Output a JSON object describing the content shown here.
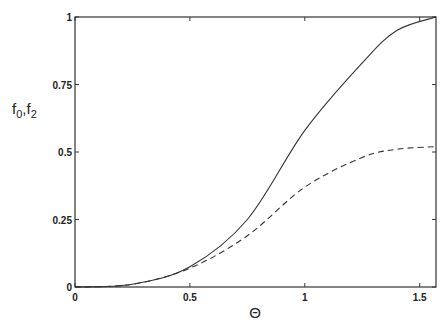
{
  "chart_data": {
    "type": "line",
    "title": "",
    "xlabel": "Θ",
    "ylabel": "f0,f2",
    "ylabel_parts": {
      "f": "f",
      "sub0": "0",
      "comma": ",",
      "f2": "f",
      "sub2": "2"
    },
    "xlim": [
      0,
      1.5708
    ],
    "ylim": [
      0,
      1
    ],
    "grid": false,
    "legend": null,
    "x_ticks": [
      0,
      0.5,
      1,
      1.5
    ],
    "x_tick_labels": [
      "0",
      "0.5",
      "1",
      "1.5"
    ],
    "y_ticks": [
      0,
      0.25,
      0.5,
      0.75,
      1
    ],
    "y_tick_labels": [
      "0",
      "0.25",
      "0.5",
      "0.75",
      "1"
    ],
    "x": [
      0,
      0.25,
      0.5,
      0.75,
      1.0,
      1.25,
      1.4,
      1.5708
    ],
    "series": [
      {
        "name": "f0",
        "style": "solid",
        "values": [
          0,
          0.01,
          0.075,
          0.25,
          0.58,
          0.83,
          0.95,
          1.0
        ]
      },
      {
        "name": "f2",
        "style": "dashed",
        "values": [
          0,
          0.01,
          0.07,
          0.19,
          0.37,
          0.48,
          0.51,
          0.52
        ]
      }
    ]
  }
}
